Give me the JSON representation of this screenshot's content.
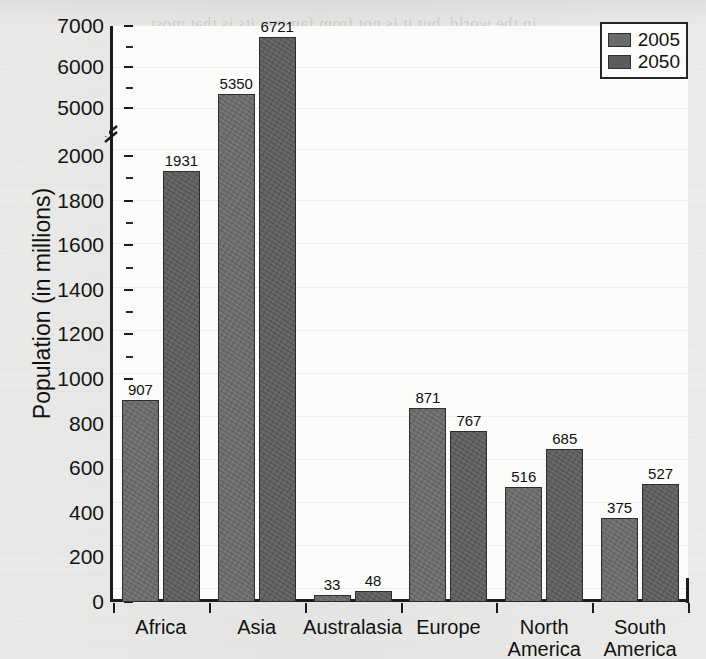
{
  "chart_data": {
    "type": "bar",
    "title": "",
    "xlabel": "",
    "ylabel": "Population (in millions)",
    "categories": [
      "Africa",
      "Asia",
      "Australasia",
      "Europe",
      "North America",
      "South America"
    ],
    "category_lines": [
      [
        "Africa"
      ],
      [
        "Asia"
      ],
      [
        "Australasia"
      ],
      [
        "Europe"
      ],
      [
        "North",
        "America"
      ],
      [
        "South",
        "America"
      ]
    ],
    "series": [
      {
        "name": "2005",
        "color": "#6a6a68",
        "values": [
          907,
          5350,
          33,
          871,
          516,
          375
        ]
      },
      {
        "name": "2050",
        "color": "#5c5c5a",
        "values": [
          1931,
          6721,
          48,
          767,
          685,
          527
        ]
      }
    ],
    "legend_position": "top-right",
    "grid": "horizontal",
    "axis_break": {
      "present": true,
      "between": [
        2000,
        5000
      ]
    },
    "ylim_lower": [
      0,
      2000
    ],
    "ylim_upper": [
      5000,
      7000
    ],
    "ytick_labels": [
      "0",
      "200",
      "400",
      "600",
      "800",
      "1000",
      "1200",
      "1400",
      "1600",
      "1800",
      "2000",
      "5000",
      "6000",
      "7000"
    ],
    "ytick_values": [
      0,
      200,
      400,
      600,
      800,
      1000,
      1200,
      1400,
      1600,
      1800,
      2000,
      5000,
      6000,
      7000
    ],
    "data_labels": [
      "907",
      "1931",
      "5350",
      "6721",
      "33",
      "48",
      "871",
      "767",
      "516",
      "685",
      "375",
      "527"
    ]
  },
  "legend": {
    "items": [
      {
        "label": "2005"
      },
      {
        "label": "2050"
      }
    ]
  },
  "axis": {
    "y_title": "Population (in millions)"
  },
  "bleed_text": {
    "lines": [
      "in the world, but it is not from famine, its is that most",
      "people are obese. Some 60 million are overweight.",
      "fast growing populations strain the environment and",
      "growth. Most annual population growth occurs in less"
    ]
  }
}
